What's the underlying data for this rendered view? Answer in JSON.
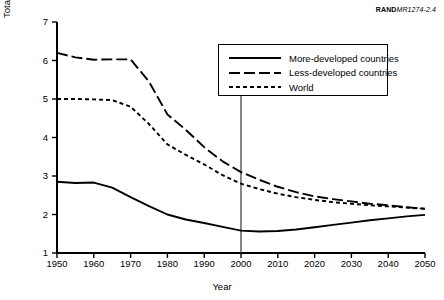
{
  "credit": {
    "brand": "RAND",
    "document_id": "MR1274-2.4"
  },
  "axes": {
    "ylabel": "Total fertility rate (live births per woman)",
    "xlabel": "Year",
    "yticks": [
      "7",
      "6",
      "5",
      "4",
      "3",
      "2",
      "1"
    ],
    "xticks": [
      "1950",
      "1960",
      "1970",
      "1980",
      "1990",
      "2000",
      "2010",
      "2020",
      "2030",
      "2040",
      "2050"
    ]
  },
  "legend": {
    "items": [
      {
        "label": "More-developed countries",
        "style": "solid"
      },
      {
        "label": "Less-developed countries",
        "style": "long-dash"
      },
      {
        "label": "World",
        "style": "short-dash"
      }
    ]
  },
  "chart_data": {
    "type": "line",
    "title": "",
    "xlabel": "Year",
    "ylabel": "Total fertility rate (live births per woman)",
    "xlim": [
      1950,
      2050
    ],
    "ylim": [
      1,
      7
    ],
    "xticks": [
      1950,
      1960,
      1970,
      1980,
      1990,
      2000,
      2010,
      2020,
      2030,
      2040,
      2050
    ],
    "yticks": [
      1,
      2,
      3,
      4,
      5,
      6,
      7
    ],
    "grid": false,
    "legend_position": "upper-right-inside",
    "annotations": [
      {
        "type": "vline",
        "x": 2000,
        "label": "year 2000 reference line"
      }
    ],
    "x": [
      1950,
      1955,
      1960,
      1965,
      1970,
      1975,
      1980,
      1985,
      1990,
      1995,
      2000,
      2005,
      2010,
      2015,
      2020,
      2025,
      2030,
      2035,
      2040,
      2045,
      2050
    ],
    "series": [
      {
        "name": "More-developed countries",
        "style": "solid",
        "values": [
          2.85,
          2.82,
          2.83,
          2.7,
          2.45,
          2.22,
          2.0,
          1.87,
          1.78,
          1.68,
          1.58,
          1.56,
          1.57,
          1.61,
          1.67,
          1.73,
          1.79,
          1.85,
          1.9,
          1.95,
          1.99
        ]
      },
      {
        "name": "Less-developed countries",
        "style": "long-dash",
        "values": [
          6.2,
          6.08,
          6.02,
          6.03,
          6.03,
          5.45,
          4.6,
          4.2,
          3.75,
          3.38,
          3.1,
          2.9,
          2.72,
          2.58,
          2.47,
          2.4,
          2.34,
          2.28,
          2.24,
          2.19,
          2.15
        ]
      },
      {
        "name": "World",
        "style": "short-dash",
        "values": [
          5.0,
          5.0,
          4.99,
          4.97,
          4.8,
          4.35,
          3.82,
          3.55,
          3.3,
          3.02,
          2.8,
          2.66,
          2.54,
          2.45,
          2.38,
          2.32,
          2.28,
          2.24,
          2.21,
          2.18,
          2.15
        ]
      }
    ]
  }
}
